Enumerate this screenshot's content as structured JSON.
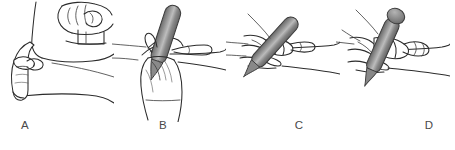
{
  "figure": {
    "background_color": "#ffffff",
    "ink_color": "#2b2b2b",
    "label_color": "#4a4a4a",
    "panel_count": 4
  },
  "syringe": {
    "body_color_dark": "#6b6b6b",
    "body_color_mid": "#8e8e8e",
    "body_color_highlight": "#bdbdbd",
    "outline_color": "#3a3a3a"
  },
  "panels": [
    {
      "id": "a",
      "label": "A",
      "caption": "Skin pinched between thumb and fingers over the forearm",
      "has_syringe": false,
      "has_inset": true,
      "inset_caption": "Close-up of fingers grasping the skin fold"
    },
    {
      "id": "b",
      "label": "B",
      "caption": "Syringe held nearly vertical above the pinched skin",
      "has_syringe": true,
      "has_inset": false,
      "syringe_angle_deg": 20
    },
    {
      "id": "c",
      "label": "C",
      "caption": "Needle inserted at a forty-five degree angle into the skin fold",
      "has_syringe": true,
      "has_inset": false,
      "syringe_angle_deg": 45
    },
    {
      "id": "d",
      "label": "D",
      "caption": "Thumb depresses the plunger to deliver the injection",
      "has_syringe": true,
      "has_inset": false,
      "syringe_angle_deg": 25
    }
  ]
}
